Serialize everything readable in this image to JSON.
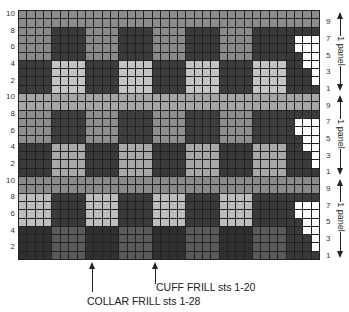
{
  "chart": {
    "columns": 36,
    "rows_per_panel": 10,
    "panels": 3,
    "block_width": 4,
    "left_row_labels": [
      "10",
      "8",
      "6",
      "4",
      "2"
    ],
    "right_row_labels": [
      "9",
      "7",
      "5",
      "3",
      "1"
    ],
    "panel_label": "1 panel",
    "panel_shades": [
      {
        "top_rows": "#8c8c8c",
        "upper_odd": "#8a8a8a",
        "upper_even": "#3a3a3a",
        "lower_odd": "#3c3c3c",
        "lower_even": "#c4c4c4"
      },
      {
        "top_rows": "#a6a6a6",
        "upper_odd": "#8e8e8e",
        "upper_even": "#3e3e3e",
        "lower_odd": "#3a3a3a",
        "lower_even": "#a8a8a8"
      },
      {
        "top_rows": "#8a8a8a",
        "upper_odd": "#bdbdbd",
        "upper_even": "#3a3a3a",
        "lower_odd": "#303030",
        "lower_even": "#5a5a5a"
      }
    ],
    "last_block_color": "#3a3a3a",
    "staircase_white": "#ffffff",
    "staircase": [
      {
        "row": 7,
        "white_cols": [
          34,
          35,
          36
        ]
      },
      {
        "row": 6,
        "white_cols": [
          34,
          35,
          36
        ]
      },
      {
        "row": 5,
        "white_cols": [
          35,
          36
        ]
      },
      {
        "row": 4,
        "white_cols": [
          35,
          36
        ]
      },
      {
        "row": 3,
        "white_cols": [
          36
        ]
      },
      {
        "row": 2,
        "white_cols": [
          36
        ]
      }
    ]
  },
  "annotations": {
    "cuff_frill": "CUFF FRILL sts 1-20",
    "collar_frill": "COLLAR FRILL sts 1-28"
  }
}
